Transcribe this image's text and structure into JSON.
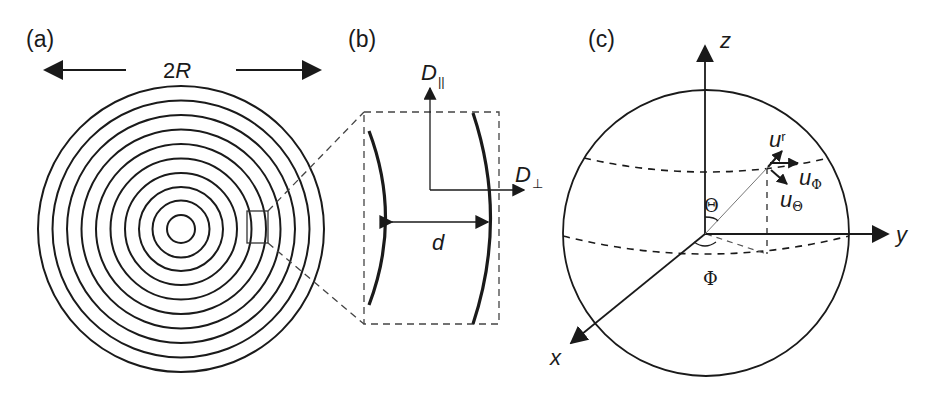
{
  "figure": {
    "panels": [
      {
        "id": "a",
        "label": "(a)",
        "description": "Concentric circles (onion-like multilayer) of diameter 2R with magnified region marked",
        "dimension_label": "2R",
        "dimension_label_main": "2",
        "dimension_label_var": "R",
        "ring_count": 10
      },
      {
        "id": "b",
        "label": "(b)",
        "description": "Magnified view of two adjacent layers separated by distance d, with diffusion directions",
        "parallel_axis_label": "D",
        "parallel_axis_subscript": "||",
        "perpendicular_axis_label": "D",
        "perpendicular_axis_subscript": "⊥",
        "spacing_label": "d"
      },
      {
        "id": "c",
        "label": "(c)",
        "description": "Spherical coordinate system with unit vectors",
        "axes": {
          "x": "x",
          "y": "y",
          "z": "z"
        },
        "angles": {
          "polar": "Θ",
          "azimuthal": "Φ"
        },
        "unit_vectors": {
          "r": {
            "base": "u",
            "sub": "r"
          },
          "phi": {
            "base": "u",
            "sub": "Φ"
          },
          "theta": {
            "base": "u",
            "sub": "Θ"
          }
        }
      }
    ],
    "colors": {
      "stroke": "#1a1a1a",
      "thin": "#555555",
      "background": "#ffffff"
    }
  }
}
